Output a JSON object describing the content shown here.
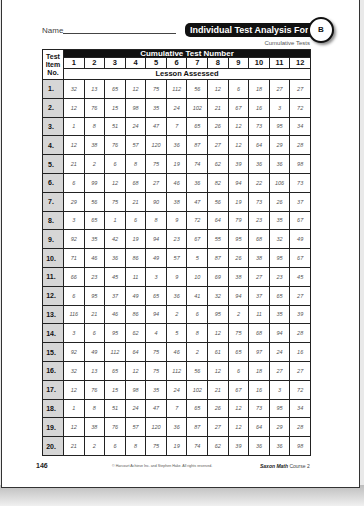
{
  "header": {
    "name_label": "Name",
    "title": "Individual Test Analysis Form",
    "form_letter": "B",
    "subtitle": "Cumulative Tests"
  },
  "table": {
    "item_header": [
      "Test",
      "Item",
      "No."
    ],
    "group_header": "Cumulative Test Number",
    "test_numbers": [
      "1",
      "2",
      "3",
      "4",
      "5",
      "6",
      "7",
      "8",
      "9",
      "10",
      "11",
      "12"
    ],
    "sub_header": "Lesson Assessed",
    "rows": [
      {
        "item": "1.",
        "values": [
          "32",
          "13",
          "65",
          "12",
          "75",
          "112",
          "56",
          "12",
          "6",
          "18",
          "27",
          "27"
        ]
      },
      {
        "item": "2.",
        "values": [
          "12",
          "76",
          "15",
          "98",
          "35",
          "24",
          "102",
          "21",
          "67",
          "16",
          "3",
          "72"
        ]
      },
      {
        "item": "3.",
        "values": [
          "1",
          "8",
          "51",
          "24",
          "47",
          "7",
          "65",
          "26",
          "12",
          "73",
          "95",
          "34"
        ]
      },
      {
        "item": "4.",
        "values": [
          "12",
          "38",
          "76",
          "57",
          "120",
          "36",
          "87",
          "27",
          "12",
          "64",
          "29",
          "28"
        ]
      },
      {
        "item": "5.",
        "values": [
          "21",
          "2",
          "6",
          "8",
          "75",
          "19",
          "74",
          "62",
          "39",
          "36",
          "36",
          "98"
        ]
      },
      {
        "item": "6.",
        "values": [
          "6",
          "99",
          "12",
          "68",
          "27",
          "46",
          "36",
          "82",
          "94",
          "22",
          "106",
          "73"
        ]
      },
      {
        "item": "7.",
        "values": [
          "29",
          "56",
          "75",
          "21",
          "90",
          "38",
          "47",
          "56",
          "19",
          "73",
          "26",
          "37"
        ]
      },
      {
        "item": "8.",
        "values": [
          "3",
          "65",
          "1",
          "6",
          "8",
          "9",
          "72",
          "64",
          "79",
          "23",
          "35",
          "67"
        ]
      },
      {
        "item": "9.",
        "values": [
          "92",
          "35",
          "42",
          "19",
          "94",
          "23",
          "67",
          "55",
          "95",
          "68",
          "32",
          "49"
        ]
      },
      {
        "item": "10.",
        "values": [
          "71",
          "46",
          "36",
          "86",
          "49",
          "57",
          "5",
          "87",
          "26",
          "38",
          "95",
          "67"
        ]
      },
      {
        "item": "11.",
        "values": [
          "66",
          "23",
          "45",
          "11",
          "3",
          "9",
          "10",
          "69",
          "38",
          "27",
          "23",
          "45"
        ]
      },
      {
        "item": "12.",
        "values": [
          "6",
          "95",
          "37",
          "49",
          "65",
          "36",
          "41",
          "32",
          "94",
          "37",
          "65",
          "27"
        ]
      },
      {
        "item": "13.",
        "values": [
          "116",
          "21",
          "46",
          "86",
          "94",
          "2",
          "6",
          "95",
          "2",
          "11",
          "35",
          "39"
        ]
      },
      {
        "item": "14.",
        "values": [
          "3",
          "6",
          "95",
          "62",
          "4",
          "5",
          "8",
          "12",
          "75",
          "68",
          "94",
          "28"
        ]
      },
      {
        "item": "15.",
        "values": [
          "92",
          "49",
          "112",
          "64",
          "75",
          "46",
          "2",
          "61",
          "65",
          "97",
          "24",
          "16"
        ]
      },
      {
        "item": "16.",
        "values": [
          "32",
          "13",
          "65",
          "12",
          "75",
          "112",
          "56",
          "12",
          "6",
          "18",
          "27",
          "27"
        ]
      },
      {
        "item": "17.",
        "values": [
          "12",
          "76",
          "15",
          "98",
          "35",
          "24",
          "102",
          "21",
          "67",
          "16",
          "3",
          "72"
        ]
      },
      {
        "item": "18.",
        "values": [
          "1",
          "8",
          "51",
          "24",
          "47",
          "7",
          "65",
          "26",
          "12",
          "73",
          "95",
          "34"
        ]
      },
      {
        "item": "19.",
        "values": [
          "12",
          "38",
          "76",
          "57",
          "120",
          "36",
          "87",
          "27",
          "12",
          "64",
          "29",
          "28"
        ]
      },
      {
        "item": "20.",
        "values": [
          "21",
          "2",
          "6",
          "8",
          "75",
          "19",
          "74",
          "62",
          "39",
          "36",
          "36",
          "98"
        ]
      }
    ]
  },
  "footer": {
    "page_number": "146",
    "copyright": "© Harcourt Achieve Inc. and Stephen Hake. All rights reserved.",
    "book_bold": "Saxon Math",
    "book_rest": " Course 2"
  },
  "colors": {
    "header_bg": "#111111",
    "item_column_bg": "#d6d6d6",
    "page_bg": "#ffffff"
  }
}
